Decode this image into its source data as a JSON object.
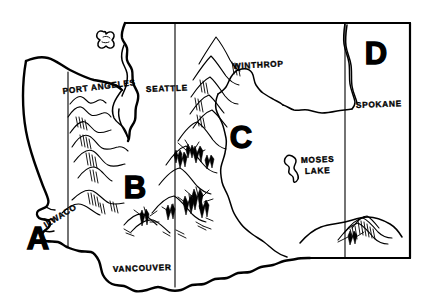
{
  "map": {
    "title": "Washington State Regions Map",
    "style": "hand-drawn ink line map",
    "background_color": "#ffffff",
    "ink_color": "#000000",
    "width": 437,
    "height": 306,
    "state": "Washington"
  },
  "regions": [
    {
      "id": "region-a",
      "label": "A",
      "x": 38,
      "y": 249,
      "description": "Southwest coastal region"
    },
    {
      "id": "region-b",
      "label": "B",
      "x": 135,
      "y": 198,
      "description": "South Cascades region"
    },
    {
      "id": "region-c",
      "label": "C",
      "x": 241,
      "y": 148,
      "description": "Central Washington region"
    },
    {
      "id": "region-d",
      "label": "D",
      "x": 376,
      "y": 64,
      "description": "Northeast region"
    }
  ],
  "cities": [
    {
      "id": "city-port-angeles",
      "label": "PORT ANGELES",
      "x": 63,
      "y": 94,
      "rotation": -7
    },
    {
      "id": "city-seattle",
      "label": "SEATTLE",
      "x": 146,
      "y": 92,
      "rotation": -2
    },
    {
      "id": "city-winthrop",
      "label": "WINTHROP",
      "x": 233,
      "y": 69,
      "rotation": -3
    },
    {
      "id": "city-spokane",
      "label": "SPOKANE",
      "x": 356,
      "y": 108,
      "rotation": -2
    },
    {
      "id": "city-ilwaco",
      "label": "ILWACO",
      "x": 46,
      "y": 228,
      "rotation": -32
    },
    {
      "id": "city-vancouver",
      "label": "VANCOUVER",
      "x": 113,
      "y": 272,
      "rotation": -2
    },
    {
      "id": "city-moses-lake",
      "label": "MOSES",
      "x": 301,
      "y": 163,
      "rotation": -2
    },
    {
      "id": "city-moses-lake-2",
      "label": "LAKE",
      "x": 305,
      "y": 174,
      "rotation": -2
    }
  ],
  "features": {
    "lake_moses": "Moses Lake outline",
    "river_columbia": "Columbia River",
    "mountains_olympic": "Olympic Mountains",
    "mountains_cascade": "Cascade Range",
    "mountains_blue": "Blue Mountains",
    "puget_sound": "Puget Sound",
    "san_juan_islands": "San Juan Islands"
  },
  "dividers": [
    {
      "id": "divider-1",
      "x": 68,
      "label": "A/B boundary"
    },
    {
      "id": "divider-2",
      "x": 175,
      "label": "B/C boundary"
    },
    {
      "id": "divider-3",
      "x": 345,
      "label": "C/D boundary"
    }
  ]
}
